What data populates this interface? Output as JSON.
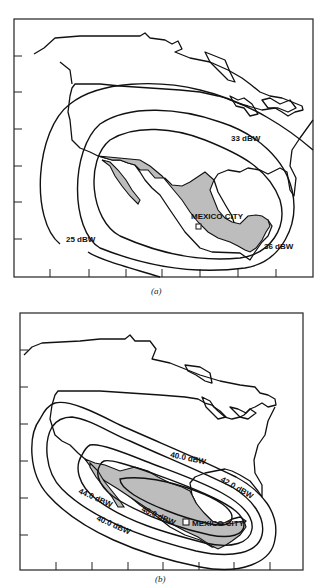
{
  "figure": {
    "panels": [
      {
        "id": "a",
        "caption": "(a)",
        "city_label": "MEXICO CITY",
        "contours": [
          {
            "label": "25 dBW",
            "value": 25
          },
          {
            "label": "33 dBW",
            "value": 33
          },
          {
            "label": "36 dBW",
            "value": 36
          }
        ]
      },
      {
        "id": "b",
        "caption": "(b)",
        "city_label": "MEXICO CITY",
        "contours": [
          {
            "label": "40.0 dBW",
            "value": 40.0,
            "position": "outer-upper"
          },
          {
            "label": "40.0 dBW",
            "value": 40.0,
            "position": "outer-lower"
          },
          {
            "label": "42.0 dBW",
            "value": 42.0
          },
          {
            "label": "44.0 dBW",
            "value": 44.0
          },
          {
            "label": "46.0 dBW",
            "value": 46.0
          }
        ]
      }
    ],
    "colors": {
      "land_outline": "#111111",
      "mexico_fill": "#bdbdbd",
      "contour_line": "#111111",
      "background": "#ffffff"
    }
  }
}
